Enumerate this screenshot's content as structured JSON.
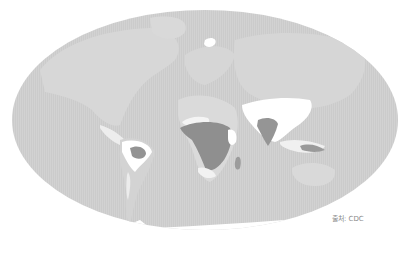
{
  "map": {
    "projection": "ellipse-world",
    "colors": {
      "ocean_and_base": "#cfcfcf",
      "land_low": "#d9d9d9",
      "risk_none_white": "#ffffff",
      "risk_high_dark": "#8e8e8e",
      "risk_medium": "#a8a8a8",
      "background": "#ffffff"
    },
    "highlighted_regions": [
      {
        "name": "Central Africa",
        "level": "high"
      },
      {
        "name": "India",
        "level": "high"
      },
      {
        "name": "Brazil (central)",
        "level": "high"
      },
      {
        "name": "Indonesia / New Guinea",
        "level": "medium"
      },
      {
        "name": "Madagascar",
        "level": "medium"
      }
    ]
  },
  "source": {
    "label": "출처: CDC"
  }
}
